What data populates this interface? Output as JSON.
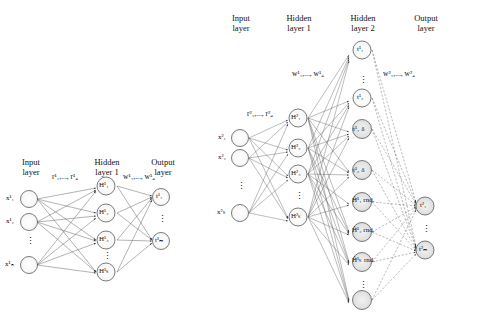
{
  "figure": {
    "left_diagram": {
      "headers": [
        {
          "id": "input-layer",
          "lines": [
            "Input",
            "layer"
          ]
        },
        {
          "id": "hidden-layer-1",
          "lines": [
            "Hidden",
            "layer 1"
          ]
        },
        {
          "id": "output-layer",
          "lines": [
            "Output",
            "layer"
          ]
        }
      ],
      "weight_labels": [
        {
          "id": "w-input-hidden",
          "text": "r¹₁,..., r¹₄"
        },
        {
          "id": "w-hidden-output",
          "text": "w¹₁,..., w¹₄"
        }
      ],
      "input_nodes": [
        "x¹₁",
        "x¹₂",
        "x¹ₙ"
      ],
      "hidden_nodes": [
        "H¹₁",
        "H¹₂",
        "H¹₃",
        "H¹ₖ"
      ],
      "output_nodes": [
        "t¹₁",
        "t¹ₘ"
      ],
      "vertical_ellipsis": [
        "input-ellipsis",
        "hidden-ellipsis",
        "output-ellipsis"
      ]
    },
    "right_diagram": {
      "headers": [
        {
          "id": "input-layer",
          "lines": [
            "Input",
            "layer"
          ]
        },
        {
          "id": "hidden-layer-1",
          "lines": [
            "Hidden",
            "layer 1"
          ]
        },
        {
          "id": "hidden-layer-2",
          "lines": [
            "Hidden",
            "layer 2"
          ]
        },
        {
          "id": "output-layer",
          "lines": [
            "Output",
            "layer"
          ]
        }
      ],
      "weight_labels": [
        {
          "id": "w-input-hidden1",
          "text": "r²₁,..., r²₄"
        },
        {
          "id": "w-hidden1-hidden2",
          "text": "w¹₁,..., w¹₄"
        },
        {
          "id": "w-hidden2-output",
          "text": "w²₁,..., w²₄"
        }
      ],
      "input_nodes": [
        "x²₁",
        "x²₂",
        "x²ₖ"
      ],
      "hidden1_nodes": [
        "H²₁",
        "H²₂",
        "H²₃",
        "H²ₖ"
      ],
      "hidden2_nodes": [
        {
          "id": "h2-1",
          "text": "t¹₁",
          "shaded": false
        },
        {
          "id": "h2-2",
          "text": "t¹₂",
          "shaded": false
        },
        {
          "id": "h2-3",
          "text": "t¹₁ δ",
          "shaded": true
        },
        {
          "id": "h2-4",
          "text": "t¹₂ δ",
          "shaded": true
        },
        {
          "id": "h2-5",
          "text": "Ĥ¹₁ rnd.",
          "shaded": true
        },
        {
          "id": "h2-6",
          "text": "Ĥ¹₂ rnd.",
          "shaded": true
        },
        {
          "id": "h2-7",
          "text": "Ĥ¹ₖ rnd.",
          "shaded": true
        }
      ],
      "output_nodes": [
        {
          "id": "out-1",
          "text": "t²₁",
          "shaded": true
        },
        {
          "id": "out-2",
          "text": "t²ₘ",
          "shaded": true
        }
      ],
      "vertical_ellipsis": [
        "input-ellipsis",
        "hidden1-ellipsis",
        "output-ellipsis"
      ]
    }
  }
}
